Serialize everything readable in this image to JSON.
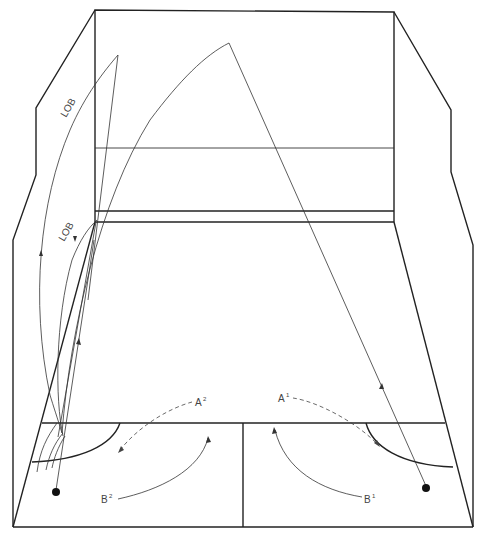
{
  "diagram": {
    "labels": {
      "lob_upper": "LOB",
      "lob_lower": "LOB",
      "a_left": "A",
      "a_left_sup": "2",
      "a_right": "A",
      "a_right_sup": "1",
      "b_left": "B",
      "b_left_sup": "2",
      "b_right": "B",
      "b_right_sup": "1"
    },
    "colors": {
      "line": "#222222",
      "background": "#ffffff"
    }
  }
}
